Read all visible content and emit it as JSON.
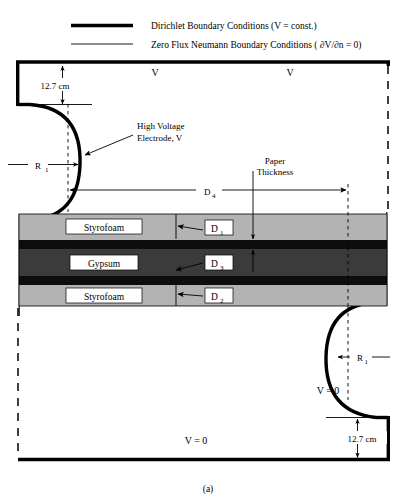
{
  "figure": {
    "caption": "(a)",
    "legend": [
      {
        "key": "dirichlet",
        "style": "thick",
        "label": "Dirichlet Boundary Conditions (V = const.)"
      },
      {
        "key": "neumann",
        "style": "thin",
        "label": "Zero Flux Neumann Boundary Conditions ( ∂V/∂n = 0)"
      }
    ],
    "potential_labels": {
      "top_left_v": "V",
      "top_right_v": "V",
      "bottom_v_zero": "V = 0",
      "right_v_zero": "V = 0"
    },
    "dimensions": {
      "top_gap": "12.7 cm",
      "bottom_gap": "12.7 cm",
      "radius_left": "R",
      "radius_left_sub": "1",
      "radius_right": "R",
      "radius_right_sub": "1",
      "d4": "D",
      "d4_sub": "4",
      "d1": "D",
      "d1_sub": "1",
      "d2": "D",
      "d2_sub": "2",
      "d3": "D",
      "d3_sub": "3",
      "paper_thickness_line1": "Paper",
      "paper_thickness_line2": "Thickness"
    },
    "annotations": {
      "electrode_line1": "High Voltage",
      "electrode_line2": "Electrode, V"
    },
    "layers": [
      {
        "name": "styrofoam-top",
        "label": "Styrofoam",
        "color": "#b3b3b3"
      },
      {
        "name": "paper-upper",
        "label": "",
        "color": "#0d0d0d"
      },
      {
        "name": "gypsum",
        "label": "Gypsum",
        "color": "#3b3b3b"
      },
      {
        "name": "paper-lower",
        "label": "",
        "color": "#0d0d0d"
      },
      {
        "name": "styrofoam-bottom",
        "label": "Styrofoam",
        "color": "#b3b3b3"
      }
    ],
    "colors": {
      "styrofoam": "#b3b3b3",
      "gypsum": "#3b3b3b",
      "paper": "#0d0d0d",
      "line": "#000000",
      "background": "#ffffff"
    }
  }
}
